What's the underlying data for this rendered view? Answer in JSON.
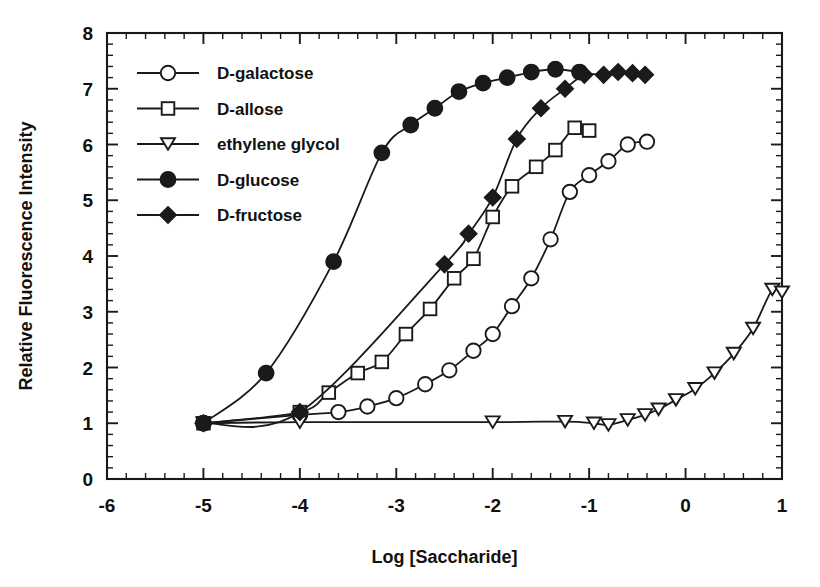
{
  "chart_data": {
    "type": "line",
    "title": "",
    "xlabel": "Log [Saccharide]",
    "ylabel": "Relative Fluorescence Intensity",
    "xlim": [
      -6,
      1
    ],
    "ylim": [
      0,
      8
    ],
    "xticks": [
      -6,
      -5,
      -4,
      -3,
      -2,
      -1,
      0,
      1
    ],
    "xticklabels": [
      "-6",
      "-5",
      "-4",
      "-3",
      "-2",
      "-1",
      "0",
      "1"
    ],
    "yticks": [
      0,
      1,
      2,
      3,
      4,
      5,
      6,
      7,
      8
    ],
    "yticklabels": [
      "0",
      "1",
      "2",
      "3",
      "4",
      "5",
      "6",
      "7",
      "8"
    ],
    "minor_ticks_per_interval": 4,
    "grid": false,
    "legend_position": "upper-left-inside",
    "series": [
      {
        "name": "D-galactose",
        "marker": "open-circle",
        "x": [
          -5.0,
          -4.0,
          -3.6,
          -3.3,
          -3.0,
          -2.7,
          -2.45,
          -2.2,
          -2.0,
          -1.8,
          -1.6,
          -1.4,
          -1.2,
          -1.0,
          -0.8,
          -0.6,
          -0.4
        ],
        "y": [
          1.0,
          1.15,
          1.2,
          1.3,
          1.45,
          1.7,
          1.95,
          2.3,
          2.6,
          3.1,
          3.6,
          4.3,
          5.15,
          5.45,
          5.7,
          6.0,
          6.05
        ]
      },
      {
        "name": "D-allose",
        "marker": "open-square",
        "x": [
          -5.0,
          -4.0,
          -3.7,
          -3.4,
          -3.15,
          -2.9,
          -2.65,
          -2.4,
          -2.2,
          -2.0,
          -1.8,
          -1.55,
          -1.35,
          -1.15,
          -1.0
        ],
        "y": [
          1.0,
          1.2,
          1.55,
          1.9,
          2.1,
          2.6,
          3.05,
          3.6,
          3.95,
          4.7,
          5.25,
          5.6,
          5.9,
          6.3,
          6.25
        ]
      },
      {
        "name": "ethylene glycol",
        "marker": "open-triangle-down",
        "x": [
          -5.0,
          -4.0,
          -2.0,
          -1.25,
          -0.95,
          -0.8,
          -0.6,
          -0.42,
          -0.28,
          -0.1,
          0.1,
          0.3,
          0.5,
          0.7,
          0.9,
          1.0
        ],
        "y": [
          1.0,
          1.02,
          1.02,
          1.03,
          1.0,
          0.97,
          1.06,
          1.15,
          1.25,
          1.42,
          1.62,
          1.9,
          2.25,
          2.7,
          3.4,
          3.35
        ]
      },
      {
        "name": "D-glucose",
        "marker": "filled-circle",
        "x": [
          -5.0,
          -4.35,
          -3.65,
          -3.15,
          -2.85,
          -2.6,
          -2.35,
          -2.1,
          -1.85,
          -1.6,
          -1.35,
          -1.1
        ],
        "y": [
          1.0,
          1.9,
          3.9,
          5.85,
          6.35,
          6.65,
          6.95,
          7.1,
          7.2,
          7.3,
          7.35,
          7.3
        ]
      },
      {
        "name": "D-fructose",
        "marker": "filled-diamond",
        "x": [
          -5.0,
          -4.0,
          -2.5,
          -2.25,
          -2.0,
          -1.75,
          -1.5,
          -1.25,
          -1.05,
          -0.85,
          -0.7,
          -0.55,
          -0.42
        ],
        "y": [
          1.0,
          1.2,
          3.85,
          4.4,
          5.05,
          6.1,
          6.65,
          7.0,
          7.25,
          7.25,
          7.3,
          7.28,
          7.25
        ]
      }
    ]
  },
  "legend": {
    "items": [
      {
        "label": "D-galactose",
        "marker": "open-circle"
      },
      {
        "label": "D-allose",
        "marker": "open-square"
      },
      {
        "label": "ethylene glycol",
        "marker": "open-triangle-down"
      },
      {
        "label": "D-glucose",
        "marker": "filled-circle"
      },
      {
        "label": "D-fructose",
        "marker": "filled-diamond"
      }
    ]
  },
  "colors": {
    "ink": "#1a1a1a",
    "background": "#ffffff",
    "marker_fill_open": "#ffffff"
  }
}
